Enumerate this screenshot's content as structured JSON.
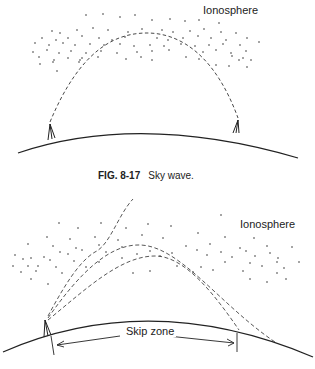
{
  "figure_top": {
    "label_ionosphere": "Ionosphere",
    "caption_number": "FIG. 8-17",
    "caption_text": "Sky wave."
  },
  "figure_bottom": {
    "label_ionosphere": "Ionosphere",
    "label_skip_zone": "Skip zone"
  },
  "colors": {
    "line": "#222222",
    "background": "#ffffff"
  }
}
